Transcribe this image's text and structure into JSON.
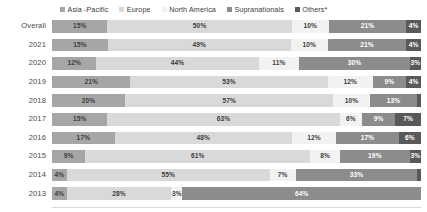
{
  "chart_data": {
    "type": "bar",
    "subtype": "horizontal-stacked-100",
    "title": "",
    "xlabel": "",
    "ylabel": "",
    "xlim": [
      0,
      100
    ],
    "grid": false,
    "legend_position": "top",
    "categories": [
      "Overall",
      "2021",
      "2020",
      "2019",
      "2018",
      "2017",
      "2016",
      "2015",
      "2014",
      "2013"
    ],
    "series": [
      {
        "name": "Asia -Pacific",
        "color": "#a6a6a6",
        "values": [
          15,
          15,
          12,
          21,
          20,
          15,
          17,
          9,
          4,
          4
        ],
        "labels": [
          "15%",
          "15%",
          "12%",
          "21%",
          "20%",
          "15%",
          "17%",
          "9%",
          "4%",
          "4%"
        ]
      },
      {
        "name": "Europe",
        "color": "#d9d9d9",
        "values": [
          50,
          49,
          44,
          53,
          57,
          63,
          48,
          61,
          55,
          28
        ],
        "labels": [
          "50%",
          "49%",
          "44%",
          "53%",
          "57%",
          "63%",
          "48%",
          "61%",
          "55%",
          "28%"
        ]
      },
      {
        "name": "North America",
        "color": "#f2f2f2",
        "values": [
          10,
          10,
          11,
          12,
          10,
          6,
          12,
          8,
          7,
          3
        ],
        "labels": [
          "10%",
          "10%",
          "11%",
          "12%",
          "10%",
          "6%",
          "12%",
          "8%",
          "7%",
          "3%"
        ]
      },
      {
        "name": "Supranationals",
        "color": "#8c8c8c",
        "values": [
          21,
          21,
          30,
          9,
          13,
          9,
          17,
          19,
          33,
          64
        ],
        "labels": [
          "21%",
          "21%",
          "30%",
          "9%",
          "13%",
          "9%",
          "17%",
          "19%",
          "33%",
          "64%"
        ]
      },
      {
        "name": "Others*",
        "color": "#595959",
        "values": [
          4,
          4,
          3,
          4,
          1,
          7,
          6,
          3,
          1,
          0
        ],
        "labels": [
          "4%",
          "4%",
          "3%",
          "4%",
          "1%",
          "7%",
          "6%",
          "3%",
          "1%",
          ""
        ]
      }
    ]
  },
  "legend": {
    "items": [
      {
        "label": "Asia -Pacific",
        "color": "#a6a6a6"
      },
      {
        "label": "Europe",
        "color": "#d9d9d9"
      },
      {
        "label": "North America",
        "color": "#f2f2f2"
      },
      {
        "label": "Supranationals",
        "color": "#8c8c8c"
      },
      {
        "label": "Others*",
        "color": "#595959"
      }
    ]
  },
  "axis": {
    "row_labels": [
      "Overall",
      "2021",
      "2020",
      "2019",
      "2018",
      "2017",
      "2016",
      "2015",
      "2014",
      "2013"
    ]
  }
}
